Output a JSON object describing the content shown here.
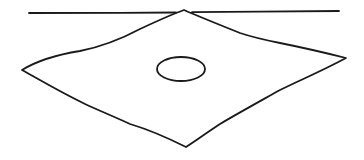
{
  "drawing": {
    "description": "Hand-drawn line sketch: a horizontal line with a quadrilateral (diamond) whose top vertex touches the line, and an ellipse drawn inside the quadrilateral",
    "stroke_color": "#1a1a1a",
    "background_color": "#ffffff",
    "elements": {
      "horizontal_line": {
        "shape": "line",
        "from": [
          29,
          13
        ],
        "to": [
          339,
          11
        ]
      },
      "quadrilateral": {
        "shape": "quadrilateral",
        "vertices": {
          "top": [
            184,
            10
          ],
          "right": [
            346,
            58
          ],
          "bottom": [
            186,
            147
          ],
          "left": [
            22,
            70
          ]
        }
      },
      "ellipse": {
        "shape": "ellipse",
        "center": [
          181,
          69
        ],
        "rx": 24,
        "ry": 12
      }
    }
  }
}
